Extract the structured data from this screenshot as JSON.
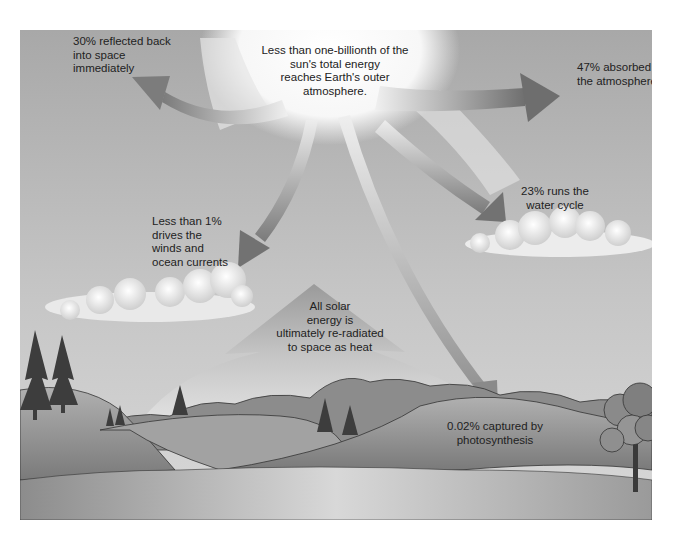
{
  "diagram": {
    "type": "solar-energy-flow",
    "background": {
      "sky_top": "#a9a9a9",
      "sky_bottom": "#d2d2d2",
      "sun_glow": "#ffffff"
    },
    "sun": {
      "label": [
        "Less than one-billionth of the",
        "sun's total energy",
        "reaches Earth's outer",
        "atmosphere."
      ]
    },
    "flows": [
      {
        "id": "reflected",
        "label": [
          "30% reflected back",
          "into space",
          "immediately"
        ],
        "percent": "30%"
      },
      {
        "id": "absorbed",
        "label": [
          "47% absorbed by",
          "the atmosphere"
        ],
        "percent": "47%"
      },
      {
        "id": "water-cycle",
        "label": [
          "23% runs the",
          "water cycle"
        ],
        "percent": "23%"
      },
      {
        "id": "winds",
        "label": [
          "Less than 1%",
          "drives the",
          "winds and",
          "ocean currents"
        ],
        "percent": "<1%"
      },
      {
        "id": "photosynthesis",
        "label": [
          "0.02% captured by",
          "photosynthesis"
        ],
        "percent": "0.02%"
      }
    ],
    "reradiation": {
      "label": [
        "All solar",
        "energy is",
        "ultimately re-radiated",
        "to space as heat"
      ]
    },
    "colors": {
      "arrow_dark": "#777777",
      "arrow_light": "#f2f2f2",
      "cloud": "#f4f4f4",
      "hill_light": "#a8a8a8",
      "hill_dark": "#6e6e6e",
      "water": "#9a9a9a",
      "tree": "#3a3a3a",
      "text": "#222222"
    }
  }
}
